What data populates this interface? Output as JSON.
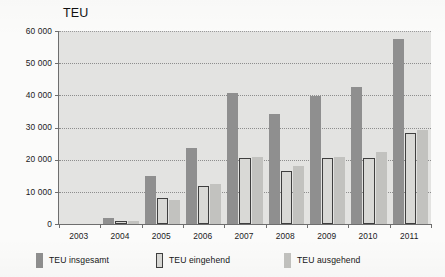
{
  "chart_data": {
    "type": "bar",
    "title": "TEU",
    "xlabel": "",
    "ylabel": "",
    "ylim": [
      0,
      60000
    ],
    "ytick_labels": [
      "60 000",
      "50 000",
      "40 000",
      "30 000",
      "20 000",
      "10 000",
      "0"
    ],
    "ytick_values": [
      60000,
      50000,
      40000,
      30000,
      20000,
      10000,
      0
    ],
    "grid": true,
    "legend_position": "bottom",
    "categories": [
      "2003",
      "2004",
      "2005",
      "2006",
      "2007",
      "2008",
      "2009",
      "2010",
      "2011"
    ],
    "series": [
      {
        "name": "TEU insgesamt",
        "color": "#8f8f8f",
        "values": [
          0,
          2000,
          15000,
          23600,
          40700,
          34300,
          39700,
          42700,
          57500
        ]
      },
      {
        "name": "TEU eingehend",
        "color": "#d9d9d6",
        "values": [
          0,
          900,
          8000,
          11700,
          20600,
          16400,
          20400,
          20500,
          28300
        ]
      },
      {
        "name": "TEU ausgehend",
        "color": "#c2c2bf",
        "values": [
          0,
          1000,
          7400,
          12300,
          20700,
          17900,
          20700,
          22300,
          29100
        ]
      }
    ]
  }
}
